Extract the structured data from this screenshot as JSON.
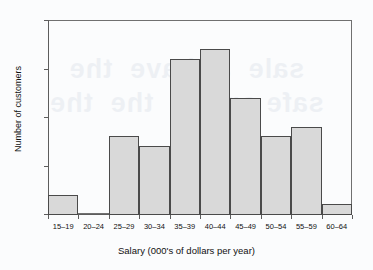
{
  "chart_data": {
    "type": "bar",
    "title": "",
    "xlabel": "Salary (000's of dollars per year)",
    "ylabel": "Number of customers",
    "categories": [
      "15–19",
      "20–24",
      "25–29",
      "30–34",
      "35–39",
      "40–44",
      "45–49",
      "50–54",
      "55–59",
      "60–64"
    ],
    "values": [
      2,
      0,
      8,
      7,
      16,
      17,
      12,
      8,
      9,
      1
    ],
    "ylim": [
      0,
      20
    ],
    "y_ticks": [
      0,
      5,
      10,
      15,
      20
    ],
    "y_tick_labels": [
      "0",
      "5",
      "10",
      "15",
      "20"
    ],
    "grid": false,
    "legend": "none",
    "bar_fill_color": "#d9d9d9",
    "bar_border_color": "#4a4a4a",
    "axis_color": "#5d5d5d",
    "background_color": "#fbfcfd"
  },
  "artifact": {
    "ghost_text": "sale  ar have  the\nsafe on the  the  the"
  }
}
